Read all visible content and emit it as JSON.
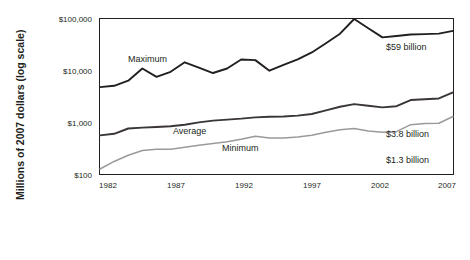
{
  "chart_data": {
    "type": "line",
    "title": "",
    "xlabel": "",
    "ylabel": "Millions of 2007 dollars (log scale)",
    "y_scale": "log",
    "ylim": [
      100,
      100000
    ],
    "xlim": [
      1982,
      2007
    ],
    "grid": false,
    "legend_position": "inline-labels",
    "y_ticks": [
      "$100",
      "$1,000",
      "$10,000",
      "$100,000"
    ],
    "y_tick_values": [
      100,
      1000,
      10000,
      100000
    ],
    "x_ticks": [
      "1982",
      "1987",
      "1992",
      "1997",
      "2002",
      "2007"
    ],
    "x_tick_values": [
      1982,
      1987,
      1992,
      1997,
      2002,
      2007
    ],
    "x": [
      1982,
      1983,
      1984,
      1985,
      1986,
      1987,
      1988,
      1989,
      1990,
      1991,
      1992,
      1993,
      1994,
      1995,
      1996,
      1997,
      1998,
      1999,
      2000,
      2001,
      2002,
      2003,
      2004,
      2005,
      2006,
      2007
    ],
    "series": [
      {
        "name": "Maximum",
        "color": "#231f20",
        "end_annotation": "$59 billion",
        "end_value": 59000,
        "values": [
          4800,
          5100,
          6400,
          11000,
          7600,
          9500,
          14500,
          11500,
          9000,
          11000,
          16500,
          16000,
          10000,
          13000,
          16500,
          22500,
          34000,
          52000,
          100000,
          66000,
          44000,
          47000,
          50000,
          51000,
          52000,
          59000
        ]
      },
      {
        "name": "Average",
        "color": "#3a3537",
        "end_annotation": "$3.8 billion",
        "end_value": 3800,
        "values": [
          560,
          600,
          760,
          790,
          810,
          840,
          900,
          1000,
          1080,
          1130,
          1180,
          1250,
          1280,
          1300,
          1350,
          1450,
          1700,
          2000,
          2250,
          2100,
          1950,
          2050,
          2700,
          2800,
          2900,
          3800
        ]
      },
      {
        "name": "Minimum",
        "color": "#9a9a9a",
        "end_annotation": "$1.3 billion",
        "end_value": 1300,
        "values": [
          125,
          175,
          230,
          285,
          300,
          300,
          330,
          360,
          390,
          420,
          470,
          540,
          500,
          500,
          520,
          560,
          640,
          720,
          760,
          680,
          640,
          660,
          900,
          950,
          960,
          1300
        ]
      }
    ],
    "annotations": [
      {
        "text": "Maximum",
        "kind": "series-label"
      },
      {
        "text": "Average",
        "kind": "series-label"
      },
      {
        "text": "Minimum",
        "kind": "series-label"
      },
      {
        "text": "$59 billion",
        "kind": "end-value"
      },
      {
        "text": "$3.8 billion",
        "kind": "end-value"
      },
      {
        "text": "$1.3 billion",
        "kind": "end-value"
      }
    ]
  }
}
